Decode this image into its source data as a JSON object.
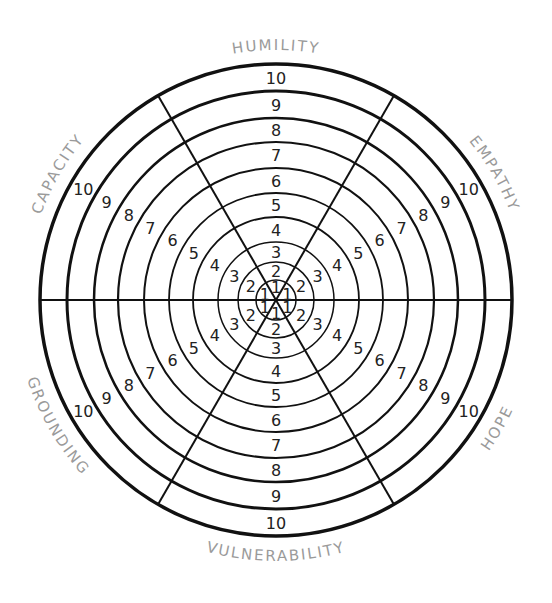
{
  "diagram": {
    "type": "radial-wheel",
    "center": [
      276,
      300
    ],
    "ring_radii": [
      20,
      38,
      58,
      83,
      107,
      132,
      158,
      182,
      209,
      236
    ],
    "ring_stroke": [
      1.5,
      1.5,
      1.5,
      1.8,
      1.8,
      2,
      2.2,
      2.5,
      3,
      3.5
    ],
    "spoke_angles_deg": [
      0,
      60,
      120
    ],
    "line_color": "#111111",
    "label_color": "#9a9a9a",
    "scale": [
      "1",
      "2",
      "3",
      "4",
      "5",
      "6",
      "7",
      "8",
      "9",
      "10"
    ],
    "segments": [
      {
        "name": "HUMILITY",
        "angle_deg": -90
      },
      {
        "name": "EMPATHY",
        "angle_deg": -30
      },
      {
        "name": "HOPE",
        "angle_deg": 30
      },
      {
        "name": "VULNERABILITY",
        "angle_deg": 90
      },
      {
        "name": "GROUNDING",
        "angle_deg": 150
      },
      {
        "name": "CAPACITY",
        "angle_deg": 210
      }
    ]
  }
}
